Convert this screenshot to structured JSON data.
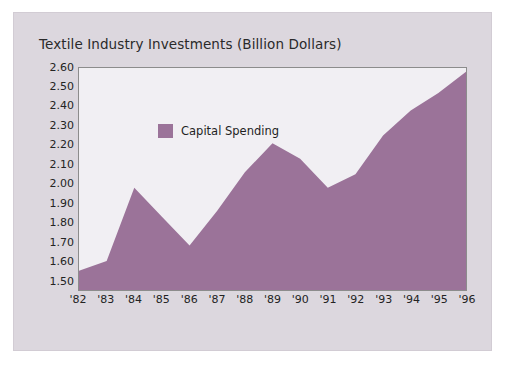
{
  "chart_data": {
    "type": "area",
    "title": "Textile Industry Investments (Billion Dollars)",
    "xlabel": "",
    "ylabel": "",
    "categories": [
      "'82",
      "'83",
      "'84",
      "'85",
      "'86",
      "'87",
      "'88",
      "'89",
      "'90",
      "'91",
      "'92",
      "'93",
      "'94",
      "'95",
      "'96"
    ],
    "series": [
      {
        "name": "Capital Spending",
        "color": "#9b7399",
        "values": [
          1.55,
          1.6,
          1.98,
          1.83,
          1.68,
          1.86,
          2.06,
          2.21,
          2.13,
          1.98,
          2.05,
          2.25,
          2.38,
          2.47,
          2.58
        ]
      }
    ],
    "ylim": [
      1.45,
      2.6
    ],
    "yticks": [
      "2.60",
      "2.50",
      "2.40",
      "2.30",
      "2.20",
      "2.10",
      "2.00",
      "1.90",
      "1.80",
      "1.70",
      "1.60",
      "1.50"
    ],
    "ytick_values": [
      2.6,
      2.5,
      2.4,
      2.3,
      2.2,
      2.1,
      2.0,
      1.9,
      1.8,
      1.7,
      1.6,
      1.5
    ],
    "grid": false,
    "legend_position": "inside-upper-left",
    "legend": [
      {
        "label": "Capital Spending",
        "color": "#9b7399"
      }
    ]
  },
  "colors": {
    "card_background": "#dcd7de",
    "plot_background": "#f1eff3",
    "area_fill": "#9b7399",
    "frame_border": "#8c8c8c",
    "text": "#232323",
    "page_background": "#ffffff"
  }
}
